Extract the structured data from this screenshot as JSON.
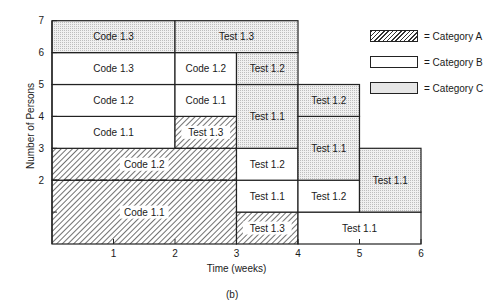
{
  "chart_data": {
    "type": "gantt-resource-loading",
    "title": "",
    "caption": "(b)",
    "xlabel": "Time (weeks)",
    "ylabel": "Number of Persons",
    "xlim": [
      0,
      6
    ],
    "ylim": [
      0,
      7
    ],
    "x_ticks": [
      "1",
      "2",
      "3",
      "4",
      "5",
      "6"
    ],
    "y_ticks": [
      "2",
      "3",
      "4",
      "5",
      "6",
      "7"
    ],
    "legend": [
      {
        "category": "A",
        "label": "= Category A",
        "fill": "hatched"
      },
      {
        "category": "B",
        "label": "= Category B",
        "fill": "white"
      },
      {
        "category": "C",
        "label": "= Category C",
        "fill": "dotted-gray"
      }
    ],
    "blocks": [
      {
        "label": "Code 1.1",
        "category": "A",
        "x0": 0,
        "x1": 3,
        "y0": 0,
        "y1": 2
      },
      {
        "label": "Code 1.2",
        "category": "A",
        "x0": 0,
        "x1": 3,
        "y0": 2,
        "y1": 3
      },
      {
        "label": "Code 1.1",
        "category": "B",
        "x0": 0,
        "x1": 2,
        "y0": 3,
        "y1": 4
      },
      {
        "label": "Code 1.2",
        "category": "B",
        "x0": 0,
        "x1": 2,
        "y0": 4,
        "y1": 5
      },
      {
        "label": "Code 1.3",
        "category": "B",
        "x0": 0,
        "x1": 2,
        "y0": 5,
        "y1": 6
      },
      {
        "label": "Code 1.3",
        "category": "C",
        "x0": 0,
        "x1": 2,
        "y0": 6,
        "y1": 7
      },
      {
        "label": "Test 1.3",
        "category": "A",
        "x0": 2,
        "x1": 3,
        "y0": 3,
        "y1": 4
      },
      {
        "label": "Code 1.1",
        "category": "B",
        "x0": 2,
        "x1": 3,
        "y0": 4,
        "y1": 5
      },
      {
        "label": "Code 1.2",
        "category": "B",
        "x0": 2,
        "x1": 3,
        "y0": 5,
        "y1": 6
      },
      {
        "label": "Test 1.3",
        "category": "C",
        "x0": 2,
        "x1": 4,
        "y0": 6,
        "y1": 7
      },
      {
        "label": "Test 1.3",
        "category": "A",
        "x0": 3,
        "x1": 4,
        "y0": 0,
        "y1": 1
      },
      {
        "label": "Test 1.1",
        "category": "B",
        "x0": 3,
        "x1": 4,
        "y0": 1,
        "y1": 2
      },
      {
        "label": "Test 1.2",
        "category": "B",
        "x0": 3,
        "x1": 4,
        "y0": 2,
        "y1": 3
      },
      {
        "label": "Test 1.1",
        "category": "C",
        "x0": 3,
        "x1": 4,
        "y0": 3,
        "y1": 5
      },
      {
        "label": "Test 1.2",
        "category": "C",
        "x0": 3,
        "x1": 4,
        "y0": 5,
        "y1": 6
      },
      {
        "label": "Test 1.1",
        "category": "B",
        "x0": 4,
        "x1": 6,
        "y0": 0,
        "y1": 1
      },
      {
        "label": "Test 1.2",
        "category": "B",
        "x0": 4,
        "x1": 5,
        "y0": 1,
        "y1": 2
      },
      {
        "label": "Test 1.1",
        "category": "C",
        "x0": 4,
        "x1": 5,
        "y0": 2,
        "y1": 4
      },
      {
        "label": "Test 1.2",
        "category": "C",
        "x0": 4,
        "x1": 5,
        "y0": 4,
        "y1": 5
      },
      {
        "label": "Test 1.1",
        "category": "C",
        "x0": 5,
        "x1": 6,
        "y0": 1,
        "y1": 3
      }
    ],
    "dashed_lines": [
      {
        "y": 2,
        "x0": 0,
        "x1": 3
      },
      {
        "y": 3,
        "x0": 2,
        "x1": 3
      }
    ],
    "grid": false
  }
}
